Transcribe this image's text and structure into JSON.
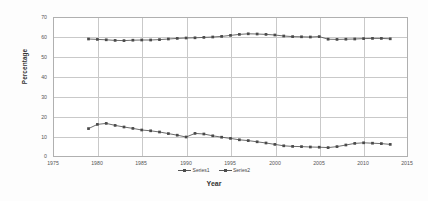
{
  "chart_data": {
    "type": "line",
    "title": "",
    "xlabel": "Year",
    "ylabel": "Percentage",
    "xlim": [
      1975,
      2015
    ],
    "ylim": [
      0,
      70
    ],
    "xticks": [
      1975,
      1980,
      1985,
      1990,
      1995,
      2000,
      2005,
      2010,
      2015
    ],
    "yticks": [
      0,
      10,
      20,
      30,
      40,
      50,
      60,
      70
    ],
    "grid": true,
    "legend_position": "bottom",
    "x": [
      1979,
      1980,
      1981,
      1982,
      1983,
      1984,
      1985,
      1986,
      1987,
      1988,
      1989,
      1990,
      1991,
      1992,
      1993,
      1994,
      1995,
      1996,
      1997,
      1998,
      1999,
      2000,
      2001,
      2002,
      2003,
      2004,
      2005,
      2006,
      2007,
      2008,
      2009,
      2010,
      2011,
      2012,
      2013
    ],
    "series": [
      {
        "name": "Series1",
        "color": "#4a4a4a",
        "values": [
          59.0,
          58.8,
          58.6,
          58.3,
          58.2,
          58.4,
          58.5,
          58.5,
          58.7,
          59.0,
          59.3,
          59.5,
          59.6,
          59.8,
          60.0,
          60.3,
          60.8,
          61.3,
          61.6,
          61.5,
          61.3,
          61.0,
          60.5,
          60.2,
          60.1,
          60.0,
          60.2,
          58.9,
          58.8,
          58.9,
          59.0,
          59.2,
          59.3,
          59.3,
          59.1
        ]
      },
      {
        "name": "Series2",
        "color": "#4a4a4a",
        "values": [
          14.2,
          16.3,
          16.8,
          15.8,
          15.0,
          14.3,
          13.5,
          13.1,
          12.5,
          11.7,
          10.9,
          10.0,
          11.8,
          11.5,
          10.6,
          9.9,
          9.3,
          8.6,
          8.2,
          7.6,
          7.0,
          6.3,
          5.6,
          5.3,
          5.2,
          5.0,
          4.9,
          4.7,
          5.2,
          6.0,
          6.8,
          7.1,
          6.9,
          6.7,
          6.3
        ]
      }
    ]
  },
  "axis": {
    "y_title": "Percentage",
    "x_title": "Year",
    "ytick_labels": [
      "70",
      "60",
      "50",
      "40",
      "30",
      "20",
      "10",
      "0"
    ],
    "xtick_labels": [
      "1975",
      "1980",
      "1985",
      "1990",
      "1995",
      "2000",
      "2005",
      "2010",
      "2015"
    ]
  },
  "legend": {
    "items": [
      {
        "label": "Series1"
      },
      {
        "label": "Series2"
      }
    ]
  },
  "colors": {
    "series": "#4a4a4a",
    "grid": "#c9c9c9",
    "plot_border": "#b0b0b0",
    "background": "#fdfdfd"
  }
}
